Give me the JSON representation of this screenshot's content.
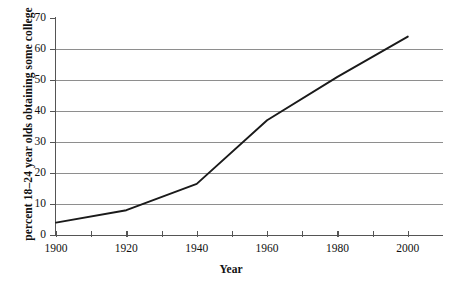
{
  "chart_data": {
    "type": "line",
    "title": "",
    "xlabel": "Year",
    "ylabel": "percent 18–24 year olds obtaining some college",
    "x": [
      1900,
      1920,
      1940,
      1960,
      1980,
      2000
    ],
    "values": [
      4,
      8,
      16.5,
      37,
      51,
      64
    ],
    "series": [
      {
        "name": "percent 18–24 year olds obtaining some college",
        "x": [
          1900,
          1920,
          1940,
          1960,
          1980,
          2000
        ],
        "values": [
          4,
          8,
          16.5,
          37,
          51,
          64
        ]
      }
    ],
    "xlim": [
      1900,
      2010
    ],
    "ylim": [
      0,
      70
    ],
    "xticks": [
      1900,
      1910,
      1920,
      1930,
      1940,
      1950,
      1960,
      1970,
      1980,
      1990,
      2000
    ],
    "xtick_labels": [
      "1900",
      "1920",
      "1940",
      "1960",
      "1980",
      "2000"
    ],
    "xtick_label_values": [
      1900,
      1920,
      1940,
      1960,
      1980,
      2000
    ],
    "yticks": [
      0,
      10,
      20,
      30,
      40,
      50,
      60,
      70
    ],
    "ytick_labels": [
      "0",
      "10",
      "20",
      "30",
      "40",
      "50",
      "60",
      "70"
    ],
    "grid": "horizontal",
    "gridlines_at": [
      10,
      20,
      30,
      40,
      50,
      60
    ],
    "legend": "none",
    "line_color": "#1a1a1a",
    "grid_color": "#8e8e8e",
    "axis_color": "#555555",
    "background": "#ffffff"
  },
  "axes": {
    "y_title": "percent 18–24 year olds obtaining some college",
    "x_title": "Year"
  },
  "caption": {
    "cropped_text": ""
  }
}
